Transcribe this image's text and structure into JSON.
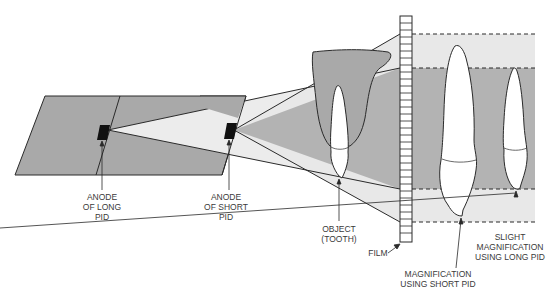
{
  "diagram": {
    "type": "dental-radiography-magnification",
    "colors": {
      "background": "#ffffff",
      "dark_gray": "#a6a6a6",
      "light_gray": "#e6e6e6",
      "mid_gray": "#b5b5b5",
      "outline": "#2a2a2a",
      "anode": "#111111",
      "tooth_fill": "#ffffff"
    },
    "labels": {
      "anode_long": [
        "ANODE",
        "OF LONG",
        "PID"
      ],
      "anode_short": [
        "ANODE",
        "OF SHORT",
        "PID"
      ],
      "object": [
        "OBJECT",
        "(TOOTH)"
      ],
      "film": "FILM",
      "mag_short": [
        "MAGNIFICATION",
        "USING SHORT PID"
      ],
      "mag_long": [
        "SLIGHT",
        "MAGNIFICATION",
        "USING LONG PID"
      ]
    }
  }
}
